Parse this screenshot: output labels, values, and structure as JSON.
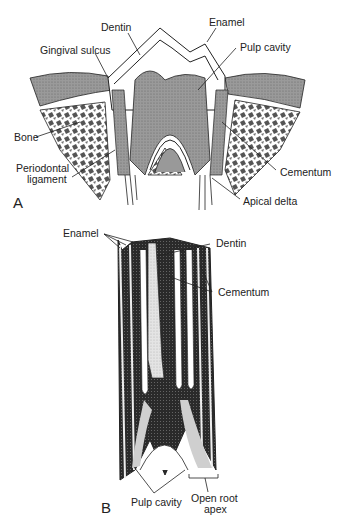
{
  "figure": {
    "panel_a": {
      "letter": "A",
      "labels": {
        "dentin": "Dentin",
        "enamel": "Enamel",
        "gingival_sulcus": "Gingival sulcus",
        "pulp_cavity": "Pulp cavity",
        "bone": "Bone",
        "periodontal_1": "Periodontal",
        "periodontal_2": "ligament",
        "cementum": "Cementum",
        "apical_delta": "Apical delta"
      }
    },
    "panel_b": {
      "letter": "B",
      "labels": {
        "enamel": "Enamel",
        "dentin": "Dentin",
        "cementum": "Cementum",
        "pulp_cavity": "Pulp cavity",
        "open_root_1": "Open root",
        "open_root_2": "apex"
      }
    },
    "colors": {
      "ink": "#222222",
      "gum": "#9a9a9a",
      "pulp": "#6e6e6e",
      "dark": "#2a2a2a",
      "light": "#cfcfcf"
    }
  }
}
